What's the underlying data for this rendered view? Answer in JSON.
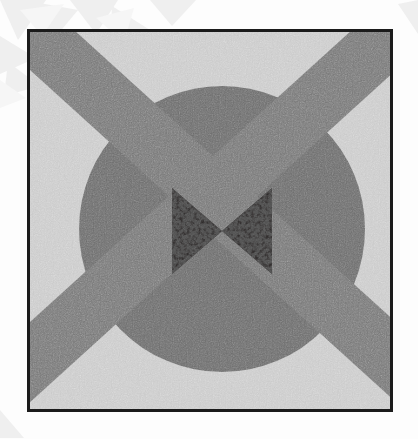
{
  "artwork": {
    "title": "Abstract geometric composition",
    "canvas": {
      "width": 418,
      "height": 439,
      "background_color": "#fdfdfd"
    },
    "frame": {
      "name": "black picture frame",
      "left": 27,
      "top": 29,
      "width": 366,
      "height": 383,
      "border_width": 3,
      "border_color": "#1b1b1b",
      "plate_color": "#cbcbcb"
    },
    "background_field": {
      "name": "light speckled field",
      "base_color": "#cbcbcb",
      "speckle_color": "#9a9a9a",
      "texture": "fine random dot stipple"
    },
    "disc": {
      "name": "large dark circle",
      "center_x": 192,
      "center_y": 197,
      "radius": 143,
      "color": "#6e6e6e"
    },
    "bands": [
      {
        "name": "diagonal band top-left to bottom-right",
        "angle_deg": 46,
        "thickness": 58,
        "color_over_background": "#767676",
        "color_over_disc": "#7d7d7d"
      },
      {
        "name": "diagonal band top-right to bottom-left",
        "angle_deg": -46,
        "thickness": 58,
        "color_over_background": "#767676",
        "color_over_disc": "#7d7d7d"
      }
    ],
    "bowtie": {
      "name": "central bowtie motif",
      "center_x": 192,
      "center_y": 199,
      "half_width": 50,
      "half_height": 43,
      "fill_color": "#332f2f",
      "texture": "high-contrast mottled speckle"
    },
    "outer_decor": {
      "name": "pale translucent shards",
      "color": "#f0f0f0",
      "shapes": 9
    }
  }
}
